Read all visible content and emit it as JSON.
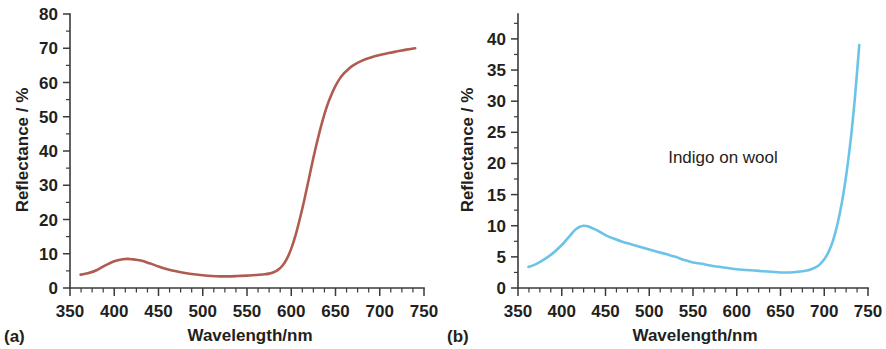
{
  "figure": {
    "background_color": "#ffffff",
    "axis_color": "#3a3a3a",
    "text_color": "#231f20"
  },
  "panels": [
    {
      "id": "a",
      "label": "(a)",
      "annotation": "",
      "curve_color": "#b05b50"
    },
    {
      "id": "b",
      "label": "(b)",
      "annotation": "Indigo on wool",
      "curve_color": "#6cc3e8"
    }
  ],
  "chart_data": [
    {
      "type": "line",
      "panel": "a",
      "title": "",
      "xlabel": "Wavelength/nm",
      "ylabel": "Reflectance / %",
      "xlim": [
        350,
        750
      ],
      "ylim": [
        0,
        80
      ],
      "xticks": [
        350,
        400,
        450,
        500,
        550,
        600,
        650,
        700,
        750
      ],
      "yticks": [
        0,
        10,
        20,
        30,
        40,
        50,
        60,
        70,
        80
      ],
      "x_minor_step": 12.5,
      "y_minor_step": 5,
      "grid": false,
      "legend": "none",
      "series": [
        {
          "name": "Reflectance",
          "color": "#b05b50",
          "x": [
            362,
            370,
            380,
            390,
            400,
            410,
            415,
            420,
            430,
            440,
            450,
            460,
            470,
            480,
            490,
            500,
            510,
            520,
            530,
            540,
            550,
            560,
            570,
            575,
            580,
            585,
            590,
            595,
            600,
            605,
            610,
            615,
            620,
            625,
            630,
            635,
            640,
            645,
            650,
            655,
            660,
            665,
            670,
            680,
            690,
            700,
            710,
            720,
            730,
            740
          ],
          "y": [
            3.9,
            4.3,
            5.2,
            6.6,
            7.8,
            8.4,
            8.5,
            8.4,
            8.0,
            7.2,
            6.3,
            5.5,
            4.9,
            4.4,
            4.0,
            3.7,
            3.5,
            3.4,
            3.4,
            3.5,
            3.6,
            3.8,
            4.0,
            4.2,
            4.6,
            5.3,
            6.5,
            8.5,
            11.5,
            15.5,
            20.5,
            26.0,
            32.0,
            38.0,
            43.5,
            48.5,
            52.8,
            56.2,
            59.0,
            61.2,
            62.8,
            64.0,
            65.0,
            66.4,
            67.3,
            68.0,
            68.6,
            69.1,
            69.6,
            70.0
          ]
        }
      ]
    },
    {
      "type": "line",
      "panel": "b",
      "title": "",
      "annotation": "Indigo on wool",
      "xlabel": "Wavelength/nm",
      "ylabel": "Reflectance / %",
      "xlim": [
        350,
        750
      ],
      "ylim": [
        0,
        44
      ],
      "xticks": [
        350,
        400,
        450,
        500,
        550,
        600,
        650,
        700,
        750
      ],
      "yticks": [
        0,
        5,
        10,
        15,
        20,
        25,
        30,
        35,
        40
      ],
      "x_minor_step": 12.5,
      "y_minor_step": 2.5,
      "grid": false,
      "legend": "none",
      "series": [
        {
          "name": "Indigo on wool",
          "color": "#6cc3e8",
          "x": [
            362,
            370,
            380,
            390,
            400,
            405,
            410,
            415,
            420,
            425,
            430,
            435,
            440,
            450,
            460,
            470,
            480,
            490,
            500,
            510,
            520,
            530,
            540,
            550,
            560,
            570,
            580,
            590,
            600,
            610,
            620,
            630,
            640,
            650,
            660,
            670,
            680,
            685,
            690,
            695,
            700,
            705,
            710,
            715,
            720,
            725,
            730,
            735,
            740
          ],
          "y": [
            3.4,
            3.8,
            4.6,
            5.6,
            6.9,
            7.7,
            8.5,
            9.3,
            9.8,
            10.0,
            9.9,
            9.6,
            9.3,
            8.5,
            7.9,
            7.4,
            7.0,
            6.6,
            6.2,
            5.8,
            5.4,
            5.0,
            4.5,
            4.1,
            3.9,
            3.6,
            3.4,
            3.2,
            3.0,
            2.9,
            2.8,
            2.7,
            2.6,
            2.5,
            2.5,
            2.6,
            2.8,
            3.0,
            3.3,
            3.8,
            4.6,
            5.8,
            7.6,
            10.2,
            13.6,
            18.0,
            23.5,
            30.5,
            39.0
          ]
        }
      ]
    }
  ]
}
